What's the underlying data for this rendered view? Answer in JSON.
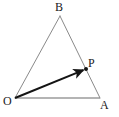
{
  "figure": {
    "type": "geometry-diagram",
    "width": 119,
    "height": 117,
    "background_color": "#ffffff",
    "labels": {
      "B": "B",
      "O": "O",
      "A": "A",
      "P": "P"
    },
    "points": {
      "O": {
        "x": 15,
        "y": 98
      },
      "A": {
        "x": 100,
        "y": 98
      },
      "B": {
        "x": 60,
        "y": 16
      },
      "P": {
        "x": 86,
        "y": 69
      }
    },
    "segments": [
      {
        "name": "side-OB",
        "from": "O",
        "to": "B",
        "color": "#8a8a8a",
        "width": 1
      },
      {
        "name": "side-BA",
        "from": "B",
        "to": "A",
        "color": "#8a8a8a",
        "width": 1
      },
      {
        "name": "side-OA",
        "from": "O",
        "to": "A",
        "color": "#b4b4b4",
        "width": 2
      }
    ],
    "vectors": [
      {
        "name": "vector-OP",
        "from": "O",
        "to": "P",
        "color": "#141414",
        "width": 2,
        "arrowhead": true
      }
    ],
    "markers": [
      {
        "name": "point-P-dot",
        "at": "P",
        "color": "#141414",
        "radius": 2
      }
    ]
  }
}
